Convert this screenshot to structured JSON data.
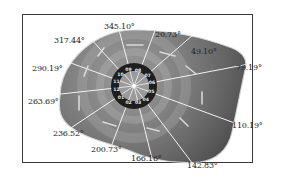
{
  "figure": {
    "center": {
      "x": 134,
      "y": 86
    },
    "segment_ids": [
      "01",
      "02",
      "03",
      "04",
      "05",
      "06",
      "07",
      "08",
      "09",
      "10",
      "11",
      "12"
    ],
    "boundary_angles": [
      {
        "label": "345.10°",
        "x": 104,
        "y": 27
      },
      {
        "label": "20.73°",
        "x": 153,
        "y": 34
      },
      {
        "label": "49.10°",
        "x": 191,
        "y": 50
      },
      {
        "label": "79.19°",
        "x": 236,
        "y": 66
      },
      {
        "label": "110.19°",
        "x": 232,
        "y": 123
      },
      {
        "label": "142.83°",
        "x": 187,
        "y": 163
      },
      {
        "label": "166.16°",
        "x": 131,
        "y": 156
      },
      {
        "label": "200.73°",
        "x": 91,
        "y": 147
      },
      {
        "label": "236.52°",
        "x": 53,
        "y": 132
      },
      {
        "label": "263.69°",
        "x": 28,
        "y": 100
      },
      {
        "label": "290.19°",
        "x": 32,
        "y": 66
      },
      {
        "label": "317.44°",
        "x": 54,
        "y": 38
      }
    ],
    "colors": {
      "frame": "#3a3a3a",
      "shape_dark": "#5a5a5a",
      "shape_mid": "#8a8a8a",
      "shape_light": "#b8b8b8",
      "ring": "#1e1e1e",
      "ring_text": "#e8e8e8",
      "divider": "#f2f2f2",
      "text": "#222222"
    }
  }
}
